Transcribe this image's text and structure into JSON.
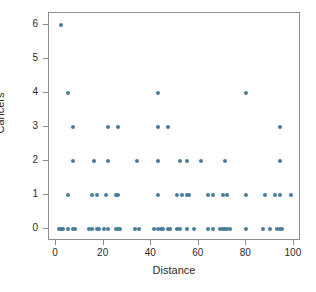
{
  "chart_data": {
    "type": "scatter",
    "title": "",
    "xlabel": "Distance",
    "ylabel": "Cancers",
    "xlim": [
      -3,
      103
    ],
    "ylim": [
      -0.35,
      6.35
    ],
    "xticks": [
      0,
      20,
      40,
      60,
      80,
      100
    ],
    "yticks": [
      0,
      1,
      2,
      3,
      4,
      5,
      6
    ],
    "xtick_labels": [
      "0",
      "20",
      "40",
      "60",
      "80",
      "100"
    ],
    "ytick_labels": [
      "0",
      "1",
      "2",
      "3",
      "4",
      "5",
      "6"
    ],
    "grid": false,
    "legend": null,
    "point_color": "#4a7c9b",
    "frame_color": "#8c8c8c",
    "background": "#ffffff",
    "points": [
      [
        2,
        6
      ],
      [
        5,
        4
      ],
      [
        43,
        4
      ],
      [
        80,
        4
      ],
      [
        7,
        3
      ],
      [
        22,
        3
      ],
      [
        26,
        3
      ],
      [
        43,
        3
      ],
      [
        47,
        3
      ],
      [
        94,
        3
      ],
      [
        7,
        2
      ],
      [
        16,
        2
      ],
      [
        22,
        2
      ],
      [
        34,
        2
      ],
      [
        43,
        2
      ],
      [
        52,
        2
      ],
      [
        55,
        2
      ],
      [
        61,
        2
      ],
      [
        71,
        2
      ],
      [
        94,
        2
      ],
      [
        5,
        1
      ],
      [
        15,
        1
      ],
      [
        17,
        1
      ],
      [
        21,
        1
      ],
      [
        25,
        1
      ],
      [
        26,
        1
      ],
      [
        43,
        1
      ],
      [
        51,
        1
      ],
      [
        53,
        1
      ],
      [
        55,
        1
      ],
      [
        56,
        1
      ],
      [
        64,
        1
      ],
      [
        66,
        1
      ],
      [
        70,
        1
      ],
      [
        72,
        1
      ],
      [
        80,
        1
      ],
      [
        88,
        1
      ],
      [
        92,
        1
      ],
      [
        94,
        1
      ],
      [
        99,
        1
      ],
      [
        1,
        0
      ],
      [
        2,
        0
      ],
      [
        3,
        0
      ],
      [
        5,
        0
      ],
      [
        7,
        0
      ],
      [
        8,
        0
      ],
      [
        14,
        0
      ],
      [
        15,
        0
      ],
      [
        17,
        0
      ],
      [
        18,
        0
      ],
      [
        20,
        0
      ],
      [
        22,
        0
      ],
      [
        25,
        0
      ],
      [
        26,
        0
      ],
      [
        27,
        0
      ],
      [
        33,
        0
      ],
      [
        35,
        0
      ],
      [
        41,
        0
      ],
      [
        43,
        0
      ],
      [
        44,
        0
      ],
      [
        45,
        0
      ],
      [
        47,
        0
      ],
      [
        48,
        0
      ],
      [
        51,
        0
      ],
      [
        52,
        0
      ],
      [
        55,
        0
      ],
      [
        58,
        0
      ],
      [
        64,
        0
      ],
      [
        66,
        0
      ],
      [
        69,
        0
      ],
      [
        70,
        0
      ],
      [
        71,
        0
      ],
      [
        72,
        0
      ],
      [
        73,
        0
      ],
      [
        80,
        0
      ],
      [
        87,
        0
      ],
      [
        90,
        0
      ],
      [
        93,
        0
      ],
      [
        94,
        0
      ],
      [
        95,
        0
      ]
    ]
  }
}
